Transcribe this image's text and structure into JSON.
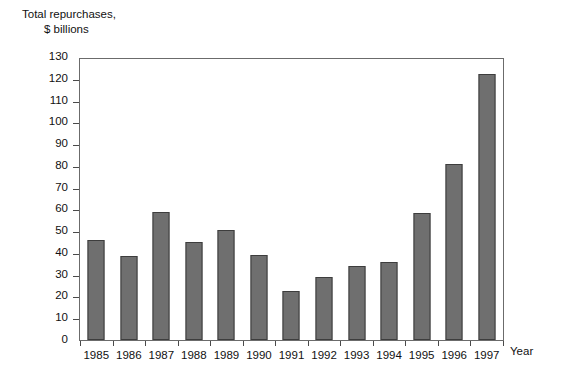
{
  "chart_data": {
    "type": "bar",
    "title": "Total repurchases, $ billions",
    "title_line1": "Total repurchases,",
    "title_line2": "$ billions",
    "xlabel": "Year",
    "ylabel": "Total repurchases, $ billions",
    "ylim": [
      0,
      130
    ],
    "ytick_step": 10,
    "grid": false,
    "legend": null,
    "bar_color": "#6f6f6f",
    "bar_edge_color": "#3d3d3d",
    "categories": [
      "1985",
      "1986",
      "1987",
      "1988",
      "1989",
      "1990",
      "1991",
      "1992",
      "1993",
      "1994",
      "1995",
      "1996",
      "1997"
    ],
    "values": [
      46,
      38.5,
      59,
      45,
      50.5,
      39,
      22.5,
      29,
      34,
      36,
      58.5,
      81,
      122
    ],
    "ytick_labels": [
      "130",
      "120",
      "110",
      "100",
      "90",
      "80",
      "70",
      "60",
      "50",
      "40",
      "30",
      "20",
      "10",
      "0"
    ],
    "ytick_values": [
      130,
      120,
      110,
      100,
      90,
      80,
      70,
      60,
      50,
      40,
      30,
      20,
      10,
      0
    ]
  }
}
